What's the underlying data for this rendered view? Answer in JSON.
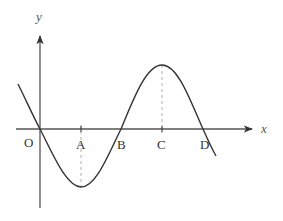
{
  "diagram": {
    "type": "function-graph",
    "colors": {
      "stroke": "#333333",
      "dashed": "#999999",
      "background": "#ffffff"
    },
    "axes": {
      "x_label": "x",
      "y_label": "y"
    },
    "points": [
      {
        "id": "O",
        "label": "O",
        "role": "origin / x-intercept"
      },
      {
        "id": "A",
        "label": "A",
        "role": "x-position of minimum"
      },
      {
        "id": "B",
        "label": "B",
        "role": "x-intercept"
      },
      {
        "id": "C",
        "label": "C",
        "role": "x-position of maximum"
      },
      {
        "id": "D",
        "label": "D",
        "role": "x-intercept"
      }
    ]
  }
}
